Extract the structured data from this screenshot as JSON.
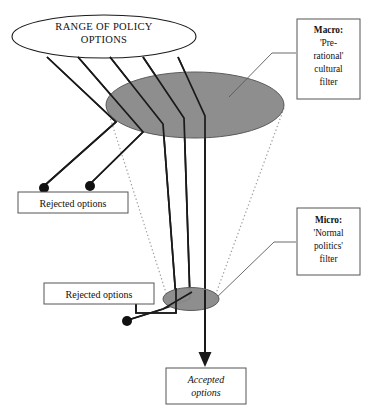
{
  "diagram": {
    "type": "funnel-filter-diagram",
    "canvas": {
      "width": 366,
      "height": 409
    },
    "colors": {
      "filter_fill": "#8a8a8a",
      "filter_stroke": "#4a4a4a",
      "line": "#1a1a1a",
      "dotted_wall": "#9a9a9a",
      "box_border": "#555555",
      "background": "#ffffff",
      "text": "#111111"
    },
    "source_oval": {
      "label_line_1": "RANGE OF POLICY",
      "label_line_2": "OPTIONS"
    },
    "macro_filter": {
      "callout_lines": [
        "Macro:",
        "'Pre-",
        "rational'",
        "cultural",
        "filter"
      ]
    },
    "micro_filter": {
      "callout_lines": [
        "Micro:",
        "'Normal",
        "politics'",
        "filter"
      ]
    },
    "rejected_upper": {
      "label": "Rejected options",
      "dot_count": 2
    },
    "rejected_lower": {
      "label": "Rejected options",
      "dot_count": 2
    },
    "outcome": {
      "label_line_1": "Accepted",
      "label_line_2": "options"
    },
    "flow": {
      "options_entering": 5,
      "rejected_at_macro": 2,
      "passing_macro": 3,
      "rejected_at_micro": 2,
      "accepted": 1
    }
  }
}
